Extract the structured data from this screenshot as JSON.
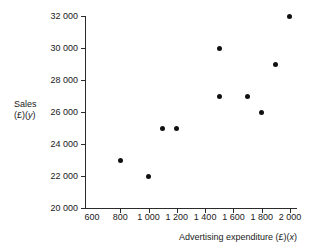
{
  "chart_data": {
    "type": "scatter",
    "title": "",
    "xlabel": "Advertising expenditure (£)(x)",
    "ylabel": "Sales (£)(y)",
    "xlim": [
      550,
      2050
    ],
    "ylim": [
      20000,
      32000
    ],
    "grid": false,
    "legend": null,
    "x_ticks": [
      600,
      800,
      1000,
      1200,
      1400,
      1600,
      1800,
      2000
    ],
    "x_tick_labels": [
      "600",
      "800",
      "1 000",
      "1 200",
      "1 400",
      "1 600",
      "1 800",
      "2 000"
    ],
    "y_ticks": [
      20000,
      22000,
      24000,
      26000,
      28000,
      30000,
      32000
    ],
    "y_tick_labels": [
      "20 000",
      "22 000",
      "24 000",
      "26 000",
      "28 000",
      "30 000",
      "32 000"
    ],
    "x": [
      800,
      1000,
      1100,
      1200,
      1500,
      1500,
      1700,
      1800,
      1900,
      2000
    ],
    "y": [
      23000,
      22000,
      25000,
      25000,
      27000,
      30000,
      27000,
      26000,
      29000,
      32000
    ],
    "points": [
      {
        "x": 800,
        "y": 23000
      },
      {
        "x": 1000,
        "y": 22000
      },
      {
        "x": 1100,
        "y": 25000
      },
      {
        "x": 1200,
        "y": 25000
      },
      {
        "x": 1500,
        "y": 27000
      },
      {
        "x": 1500,
        "y": 30000
      },
      {
        "x": 1700,
        "y": 27000
      },
      {
        "x": 1800,
        "y": 26000
      },
      {
        "x": 1900,
        "y": 29000
      },
      {
        "x": 2000,
        "y": 32000
      }
    ],
    "marker_color": "#111111",
    "axis_color": "#2b2b2b"
  },
  "axes": {
    "y_title_line1": "Sales",
    "y_title_line2_prefix": "(£)(",
    "y_title_line2_var": "y",
    "y_title_line2_suffix": ")",
    "x_title_prefix": "Advertising expenditure (£)(",
    "x_title_var": "x",
    "x_title_suffix": ")"
  }
}
